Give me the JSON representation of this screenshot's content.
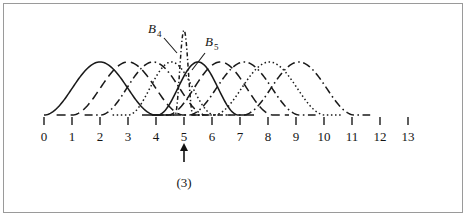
{
  "figure": {
    "caption": "(3)",
    "marker_position": 5,
    "marker_icon": "up-arrow-icon",
    "border_color": "#9a9a9a",
    "ink_color": "#1a1a1a"
  },
  "labels": [
    {
      "id": "b4",
      "base": "B",
      "sub": "4",
      "x": 148,
      "y": 33
    },
    {
      "id": "b5",
      "base": "B",
      "sub": "5",
      "x": 205,
      "y": 46
    }
  ],
  "chart_data": {
    "type": "line",
    "title": "",
    "subtitle": "",
    "xlabel": "",
    "ylabel": "",
    "xlim": [
      0,
      13
    ],
    "ylim": [
      0,
      1
    ],
    "grid": false,
    "legend": "annotations",
    "tick_labels": [
      "0",
      "1",
      "2",
      "3",
      "4",
      "5",
      "6",
      "7",
      "8",
      "9",
      "10",
      "11",
      "12",
      "13"
    ],
    "x": [
      0,
      1,
      2,
      3,
      4,
      5,
      6,
      7,
      8,
      9,
      10,
      11,
      12,
      13
    ],
    "annotations": [
      {
        "text": "B 4",
        "points_to_x": 5.0,
        "kind": "spline-label"
      },
      {
        "text": "B 5",
        "points_to_x": 5.4,
        "kind": "spline-label"
      },
      {
        "text": "(3)",
        "points_to_x": 5,
        "kind": "caption"
      }
    ],
    "series": [
      {
        "name": "B0",
        "center": 2.0,
        "halfwidth": 2.0,
        "peak": 1.0,
        "dash": "solid"
      },
      {
        "name": "B1",
        "center": 3.0,
        "halfwidth": 2.0,
        "peak": 1.0,
        "dash": "long-dash"
      },
      {
        "name": "B2",
        "center": 3.9,
        "halfwidth": 1.9,
        "peak": 1.0,
        "dash": "dash-dot"
      },
      {
        "name": "B3",
        "center": 4.55,
        "halfwidth": 1.55,
        "peak": 1.0,
        "dash": "dotted"
      },
      {
        "name": "B4",
        "center": 5.0,
        "halfwidth": 0.32,
        "peak": 1.6,
        "dash": "dash-dot-narrow"
      },
      {
        "name": "B5",
        "center": 5.5,
        "halfwidth": 1.45,
        "peak": 1.0,
        "dash": "solid"
      },
      {
        "name": "B6",
        "center": 6.3,
        "halfwidth": 1.9,
        "peak": 1.0,
        "dash": "long-dash"
      },
      {
        "name": "B7",
        "center": 7.15,
        "halfwidth": 2.0,
        "peak": 1.0,
        "dash": "dash-dot"
      },
      {
        "name": "B8",
        "center": 8.05,
        "halfwidth": 2.0,
        "peak": 1.0,
        "dash": "dotted"
      },
      {
        "name": "B9",
        "center": 9.1,
        "halfwidth": 2.0,
        "peak": 1.0,
        "dash": "dash-dot"
      }
    ],
    "axis": {
      "tick_start_px": 44,
      "tick_spacing_px": 28,
      "baseline_y_px": 115,
      "peak_y_px": 62
    }
  }
}
